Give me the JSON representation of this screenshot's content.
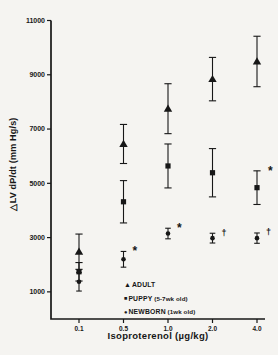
{
  "figure": {
    "background": "#f5f4f1",
    "ink": "#171717"
  },
  "chart_data": {
    "type": "scatter",
    "title": "",
    "xlabel": "Isoproterenol  (µg/kg)",
    "ylabel": "△LV dP/dt (mm Hg/s)",
    "x_scale": "categorical",
    "categories": [
      "0.1",
      "0.5",
      "1.0",
      "2.0",
      "4.0"
    ],
    "y_ticks": [
      1000,
      3000,
      5000,
      7000,
      9000,
      11000
    ],
    "ylim": [
      0,
      11000
    ],
    "grid": false,
    "error_bars": "mean ± SE",
    "legend_position": "inside-lower-right",
    "series": [
      {
        "name": "ADULT",
        "note": "",
        "marker": "triangle",
        "values": [
          2480,
          6450,
          7750,
          8840,
          9490
        ],
        "errors": [
          650,
          720,
          920,
          800,
          930
        ],
        "annotations": [
          "",
          "",
          "",
          "",
          ""
        ]
      },
      {
        "name": "PUPPY",
        "note": "(5-7wk  old)",
        "marker": "square",
        "values": [
          1740,
          4320,
          5640,
          5390,
          4840
        ],
        "errors": [
          340,
          780,
          810,
          890,
          620
        ],
        "annotations": [
          "",
          "",
          "",
          "",
          "*"
        ]
      },
      {
        "name": "NEWBORN",
        "note": "(1wk old)",
        "marker": "circle",
        "values": [
          1370,
          2200,
          3150,
          2980,
          2980
        ],
        "errors": [
          340,
          290,
          195,
          180,
          190
        ],
        "annotations": [
          "",
          "*",
          "*",
          "†",
          "†"
        ]
      }
    ]
  }
}
